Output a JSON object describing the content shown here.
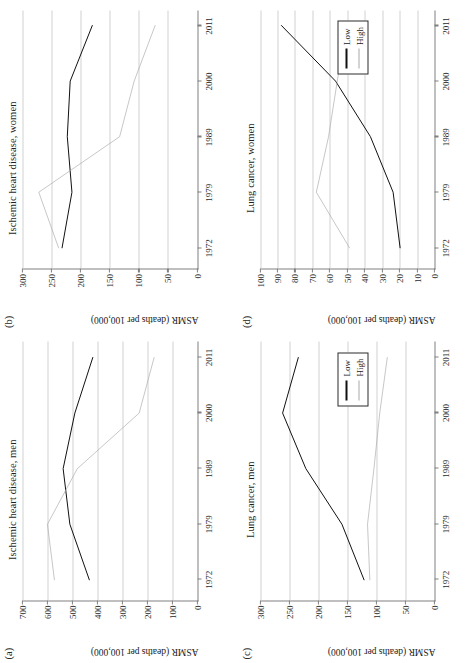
{
  "figure": {
    "yaxis_label": "ASMR (deaths per 100,000)",
    "legend": {
      "low_label": "Low",
      "high_label": "High"
    },
    "colors": {
      "low": "#111111",
      "high": "#a8a8a8",
      "grid": "#d2d2d2",
      "axis": "#808080"
    }
  },
  "panels": [
    {
      "tag": "(a)",
      "title": "Ischemic heart disease, men",
      "ylim": [
        0,
        700
      ],
      "yticks": [
        0,
        100,
        200,
        300,
        400,
        500,
        600,
        700
      ],
      "xticks": [
        "1972",
        "1979",
        "1989",
        "2000",
        "2011"
      ]
    },
    {
      "tag": "(b)",
      "title": "Ischemic heart disease, women",
      "ylim": [
        0,
        300
      ],
      "yticks": [
        0,
        50,
        100,
        150,
        200,
        250,
        300
      ],
      "xticks": [
        "1972",
        "1979",
        "1989",
        "2000",
        "2011"
      ]
    },
    {
      "tag": "(c)",
      "title": "Lung cancer, men",
      "ylim": [
        0,
        300
      ],
      "yticks": [
        0,
        50,
        100,
        150,
        200,
        250,
        300
      ],
      "xticks": [
        "1972",
        "1979",
        "1989",
        "2000",
        "2011"
      ]
    },
    {
      "tag": "(d)",
      "title": "Lung cancer, women",
      "ylim": [
        0,
        100
      ],
      "yticks": [
        0,
        10,
        20,
        30,
        40,
        50,
        60,
        70,
        80,
        90,
        100
      ],
      "xticks": [
        "1972",
        "1979",
        "1989",
        "2000",
        "2011"
      ]
    }
  ],
  "chart_data": [
    {
      "type": "line",
      "title": "Ischemic heart disease, men",
      "panel": "(a)",
      "xlabel": "",
      "ylabel": "ASMR (deaths per 100,000)",
      "categories": [
        "1972",
        "1979",
        "1989",
        "2000",
        "2011"
      ],
      "ylim": [
        0,
        700
      ],
      "grid": true,
      "legend_position": "none",
      "series": [
        {
          "name": "Low",
          "values": [
            432,
            510,
            537,
            490,
            418
          ]
        },
        {
          "name": "High",
          "values": [
            572,
            600,
            480,
            232,
            172
          ]
        }
      ]
    },
    {
      "type": "line",
      "title": "Ischemic heart disease, women",
      "panel": "(b)",
      "xlabel": "",
      "ylabel": "ASMR (deaths per 100,000)",
      "categories": [
        "1972",
        "1979",
        "1989",
        "2000",
        "2011"
      ],
      "ylim": [
        0,
        300
      ],
      "grid": true,
      "legend_position": "none",
      "series": [
        {
          "name": "Low",
          "values": [
            232,
            215,
            223,
            218,
            180
          ]
        },
        {
          "name": "High",
          "values": [
            238,
            272,
            133,
            108,
            72
          ]
        }
      ]
    },
    {
      "type": "line",
      "title": "Lung cancer, men",
      "panel": "(c)",
      "xlabel": "",
      "ylabel": "ASMR (deaths per 100,000)",
      "categories": [
        "1972",
        "1979",
        "1989",
        "2000",
        "2011"
      ],
      "ylim": [
        0,
        300
      ],
      "grid": true,
      "legend_position": "inside-right",
      "series": [
        {
          "name": "Low",
          "values": [
            122,
            160,
            222,
            262,
            235
          ]
        },
        {
          "name": "High",
          "values": [
            112,
            116,
            105,
            95,
            82
          ]
        }
      ]
    },
    {
      "type": "line",
      "title": "Lung cancer, women",
      "panel": "(d)",
      "xlabel": "",
      "ylabel": "ASMR (deaths per 100,000)",
      "categories": [
        "1972",
        "1979",
        "1989",
        "2000",
        "2011"
      ],
      "ylim": [
        0,
        100
      ],
      "grid": true,
      "legend_position": "inside-right",
      "series": [
        {
          "name": "Low",
          "values": [
            20,
            24,
            37,
            57,
            88
          ]
        },
        {
          "name": "High",
          "values": [
            49,
            68,
            61,
            56,
            51
          ]
        }
      ]
    }
  ]
}
